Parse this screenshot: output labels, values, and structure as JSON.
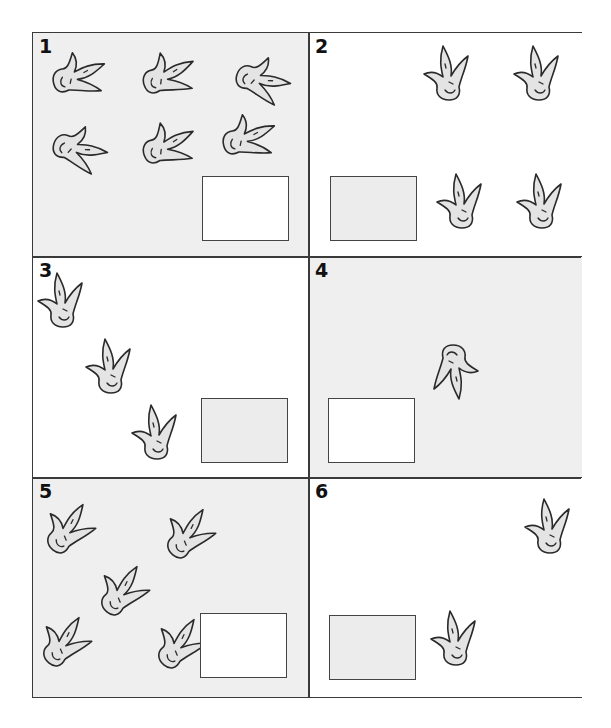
{
  "worksheet": {
    "panels": [
      {
        "number": "1",
        "footprint_count": 6,
        "background": "gray",
        "answer_box_fill": "white",
        "answer": ""
      },
      {
        "number": "2",
        "footprint_count": 4,
        "background": "white",
        "answer_box_fill": "gray",
        "answer": ""
      },
      {
        "number": "3",
        "footprint_count": 3,
        "background": "white",
        "answer_box_fill": "gray",
        "answer": ""
      },
      {
        "number": "4",
        "footprint_count": 1,
        "background": "gray",
        "answer_box_fill": "white",
        "answer": ""
      },
      {
        "number": "5",
        "footprint_count": 5,
        "background": "gray",
        "answer_box_fill": "white",
        "answer": ""
      },
      {
        "number": "6",
        "footprint_count": 2,
        "background": "white",
        "answer_box_fill": "gray",
        "answer": ""
      }
    ],
    "icon": "dinosaur-footprint-icon",
    "colors": {
      "gray_panel": "#efefef",
      "outline": "#2a2a2a",
      "print_fill": "#e4e4e4"
    }
  }
}
